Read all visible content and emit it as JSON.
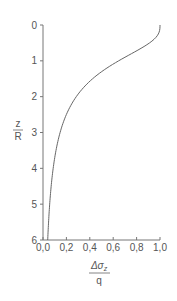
{
  "chart_data": {
    "type": "line",
    "title": "",
    "xlabel": "Δσz / q",
    "ylabel": "z / R",
    "xlabel_parts": {
      "numerator": "Δσ",
      "subscript": "z",
      "denominator": "q"
    },
    "ylabel_parts": {
      "numerator": "z",
      "denominator": "R"
    },
    "xlim": [
      0.0,
      1.0
    ],
    "ylim": [
      6,
      0
    ],
    "y_inverted": true,
    "grid": false,
    "x_ticks": [
      "0.0",
      "0.2",
      "0.4",
      "0.6",
      "0.8",
      "1.0"
    ],
    "y_ticks": [
      "0",
      "1",
      "2",
      "3",
      "4",
      "5",
      "6"
    ],
    "series": [
      {
        "name": "stress ratio",
        "x": [
          1.0,
          0.911,
          0.646,
          0.424,
          0.284,
          0.2,
          0.146,
          0.111,
          0.087,
          0.057,
          0.04
        ],
        "y": [
          0,
          0.5,
          1,
          1.5,
          2,
          2.5,
          3,
          3.5,
          4,
          5,
          6
        ]
      }
    ],
    "colors": {
      "line": "#666666",
      "axis": "#777777",
      "text": "#555555"
    }
  }
}
